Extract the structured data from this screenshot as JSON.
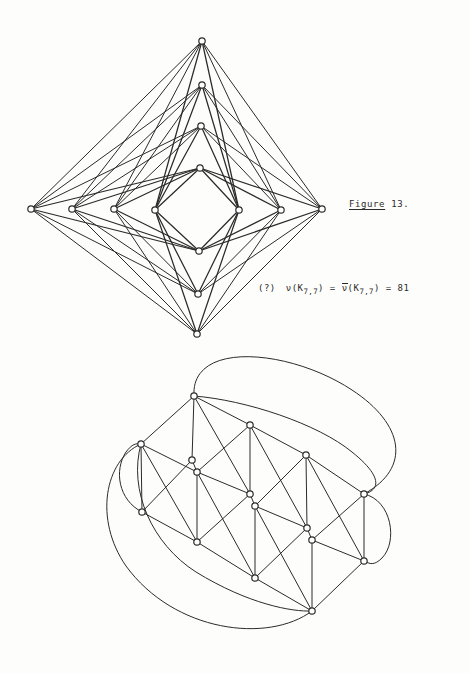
{
  "page": {
    "background": "#fdfdfc",
    "ink": "#2b2b2b",
    "width": 470,
    "height": 673
  },
  "figure_label": {
    "underlined_word": "Figure",
    "number": " 13."
  },
  "formula": {
    "marker": "(?)",
    "lhs_fn": "ν",
    "lhs_arg": "(K",
    "lhs_sub": "7,7",
    "lhs_close": ")",
    "eq1": "=",
    "rhs_fn": "ν",
    "rhs_arg": "(K",
    "rhs_sub": "7,7",
    "rhs_close": ")",
    "eq2": "=",
    "value": "81",
    "plain": "(?)  ν(K7,7) = ν̅(K7,7) = 81"
  },
  "figure_top": {
    "name": "nested-diamond-k77-drawing",
    "description": "Complete bipartite graph K(7,7) drawn as nested diamonds",
    "vertices_vertical": [
      {
        "id": "T1",
        "x": 202,
        "y": 41
      },
      {
        "id": "T2",
        "x": 202,
        "y": 85
      },
      {
        "id": "T3",
        "x": 201,
        "y": 126
      },
      {
        "id": "T4",
        "x": 200,
        "y": 168
      },
      {
        "id": "B4",
        "x": 199,
        "y": 251
      },
      {
        "id": "B3",
        "x": 198,
        "y": 294
      },
      {
        "id": "B2",
        "x": 197,
        "y": 334
      }
    ],
    "vertices_horizontal": [
      {
        "id": "L1",
        "x": 31,
        "y": 209
      },
      {
        "id": "L2",
        "x": 72,
        "y": 209
      },
      {
        "id": "L3",
        "x": 114,
        "y": 209
      },
      {
        "id": "L4",
        "x": 155,
        "y": 210
      },
      {
        "id": "R4",
        "x": 239,
        "y": 210
      },
      {
        "id": "R3",
        "x": 281,
        "y": 210
      },
      {
        "id": "R2",
        "x": 322,
        "y": 209
      }
    ],
    "node_radius": 3.2,
    "edge_width": 1.0
  },
  "figure_bottom": {
    "name": "triangulated-grid-torus-embedding",
    "description": "Triangulated grid with wrap-around arcs (toroidal embedding)",
    "grid_nodes": [
      {
        "id": "a1",
        "x": 194,
        "y": 396
      },
      {
        "id": "a2",
        "x": 250,
        "y": 425
      },
      {
        "id": "a3",
        "x": 306,
        "y": 455
      },
      {
        "id": "b0",
        "x": 141,
        "y": 444
      },
      {
        "id": "b1",
        "x": 192,
        "y": 460
      },
      {
        "id": "b1b",
        "x": 197,
        "y": 472
      },
      {
        "id": "b2",
        "x": 250,
        "y": 494
      },
      {
        "id": "b2b",
        "x": 255,
        "y": 506
      },
      {
        "id": "b3",
        "x": 307,
        "y": 528
      },
      {
        "id": "b3b",
        "x": 312,
        "y": 540
      },
      {
        "id": "r1",
        "x": 364,
        "y": 494
      },
      {
        "id": "r2",
        "x": 364,
        "y": 561
      },
      {
        "id": "c0",
        "x": 142,
        "y": 512
      },
      {
        "id": "c1",
        "x": 197,
        "y": 542
      },
      {
        "id": "c2",
        "x": 255,
        "y": 578
      },
      {
        "id": "c3",
        "x": 312,
        "y": 611
      }
    ],
    "node_radius": 3.2,
    "edge_width": 1.0,
    "curve_width": 1.0
  }
}
